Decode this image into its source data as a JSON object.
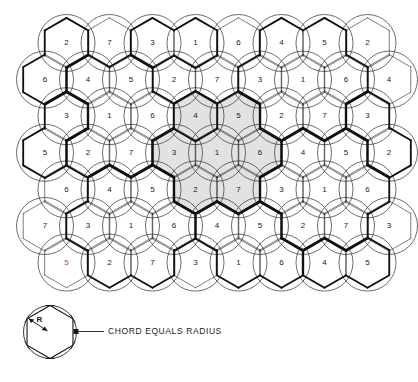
{
  "figure": {
    "geometry": {
      "circle_radius": 28.5,
      "col_spacing": 43.0,
      "row_spacing": 36.6,
      "origin_x": 66.5,
      "origin_y": 43.0,
      "odd_row_offset": -21.5
    },
    "colors": {
      "cluster_fill": "#e2e2e2",
      "circle_stroke": "#3c3c3c",
      "hex_stroke": "#111111",
      "hex_accent_green": "#2f6b3a",
      "label_text": "#1a1a1a",
      "highlight_text": "#9c4a57",
      "background": "#ffffff"
    },
    "grid": {
      "rows": [
        {
          "index": 0,
          "offset": false,
          "cells": [
            {
              "id": "r0c0",
              "label": "2",
              "shaded": false,
              "highlight": false
            },
            {
              "id": "r0c1",
              "label": "7",
              "shaded": false,
              "highlight": false
            },
            {
              "id": "r0c2",
              "label": "3",
              "shaded": false,
              "highlight": false
            },
            {
              "id": "r0c3",
              "label": "1",
              "shaded": false,
              "highlight": false
            },
            {
              "id": "r0c4",
              "label": "6",
              "shaded": false,
              "highlight": false
            },
            {
              "id": "r0c5",
              "label": "4",
              "shaded": false,
              "highlight": false
            },
            {
              "id": "r0c6",
              "label": "5",
              "shaded": false,
              "highlight": false
            },
            {
              "id": "r0c7",
              "label": "2",
              "shaded": false,
              "highlight": false
            }
          ]
        },
        {
          "index": 1,
          "offset": true,
          "cells": [
            {
              "id": "r1c0",
              "label": "6",
              "shaded": false,
              "highlight": false
            },
            {
              "id": "r1c1",
              "label": "4",
              "shaded": false,
              "highlight": false
            },
            {
              "id": "r1c2",
              "label": "5",
              "shaded": false,
              "highlight": false
            },
            {
              "id": "r1c3",
              "label": "2",
              "shaded": false,
              "highlight": false
            },
            {
              "id": "r1c4",
              "label": "7",
              "shaded": false,
              "highlight": false
            },
            {
              "id": "r1c5",
              "label": "3",
              "shaded": false,
              "highlight": false
            },
            {
              "id": "r1c6",
              "label": "1",
              "shaded": false,
              "highlight": false
            },
            {
              "id": "r1c7",
              "label": "6",
              "shaded": false,
              "highlight": false
            },
            {
              "id": "r1c8",
              "label": "4",
              "shaded": false,
              "highlight": false
            }
          ]
        },
        {
          "index": 2,
          "offset": false,
          "cells": [
            {
              "id": "r2c0",
              "label": "3",
              "shaded": false,
              "highlight": false
            },
            {
              "id": "r2c1",
              "label": "1",
              "shaded": false,
              "highlight": false
            },
            {
              "id": "r2c2",
              "label": "6",
              "shaded": false,
              "highlight": false
            },
            {
              "id": "r2c3",
              "label": "4",
              "shaded": true,
              "highlight": false
            },
            {
              "id": "r2c4",
              "label": "5",
              "shaded": true,
              "highlight": false
            },
            {
              "id": "r2c5",
              "label": "2",
              "shaded": false,
              "highlight": false
            },
            {
              "id": "r2c6",
              "label": "7",
              "shaded": false,
              "highlight": false
            },
            {
              "id": "r2c7",
              "label": "3",
              "shaded": false,
              "highlight": false
            }
          ]
        },
        {
          "index": 3,
          "offset": true,
          "cells": [
            {
              "id": "r3c0",
              "label": "5",
              "shaded": false,
              "highlight": false
            },
            {
              "id": "r3c1",
              "label": "2",
              "shaded": false,
              "highlight": false
            },
            {
              "id": "r3c2",
              "label": "7",
              "shaded": false,
              "highlight": false
            },
            {
              "id": "r3c3",
              "label": "3",
              "shaded": true,
              "highlight": false
            },
            {
              "id": "r3c4",
              "label": "1",
              "shaded": true,
              "highlight": false
            },
            {
              "id": "r3c5",
              "label": "6",
              "shaded": true,
              "highlight": false
            },
            {
              "id": "r3c6",
              "label": "4",
              "shaded": false,
              "highlight": false
            },
            {
              "id": "r3c7",
              "label": "5",
              "shaded": false,
              "highlight": false
            },
            {
              "id": "r3c8",
              "label": "2",
              "shaded": false,
              "highlight": false
            }
          ]
        },
        {
          "index": 4,
          "offset": false,
          "cells": [
            {
              "id": "r4c0",
              "label": "6",
              "shaded": false,
              "highlight": false
            },
            {
              "id": "r4c1",
              "label": "4",
              "shaded": false,
              "highlight": false
            },
            {
              "id": "r4c2",
              "label": "5",
              "shaded": false,
              "highlight": false
            },
            {
              "id": "r4c3",
              "label": "2",
              "shaded": true,
              "highlight": false
            },
            {
              "id": "r4c4",
              "label": "7",
              "shaded": true,
              "highlight": false
            },
            {
              "id": "r4c5",
              "label": "3",
              "shaded": false,
              "highlight": false
            },
            {
              "id": "r4c6",
              "label": "1",
              "shaded": false,
              "highlight": false
            },
            {
              "id": "r4c7",
              "label": "6",
              "shaded": false,
              "highlight": false
            }
          ]
        },
        {
          "index": 5,
          "offset": true,
          "cells": [
            {
              "id": "r5c0",
              "label": "7",
              "shaded": false,
              "highlight": false
            },
            {
              "id": "r5c1",
              "label": "3",
              "shaded": false,
              "highlight": false
            },
            {
              "id": "r5c2",
              "label": "1",
              "shaded": false,
              "highlight": false
            },
            {
              "id": "r5c3",
              "label": "6",
              "shaded": false,
              "highlight": false
            },
            {
              "id": "r5c4",
              "label": "4",
              "shaded": false,
              "highlight": false
            },
            {
              "id": "r5c5",
              "label": "5",
              "shaded": false,
              "highlight": false
            },
            {
              "id": "r5c6",
              "label": "2",
              "shaded": false,
              "highlight": false
            },
            {
              "id": "r5c7",
              "label": "7",
              "shaded": false,
              "highlight": false
            },
            {
              "id": "r5c8",
              "label": "3",
              "shaded": false,
              "highlight": false
            }
          ]
        },
        {
          "index": 6,
          "offset": false,
          "cells": [
            {
              "id": "r6c0",
              "label": "5",
              "shaded": false,
              "highlight": true
            },
            {
              "id": "r6c1",
              "label": "2",
              "shaded": false,
              "highlight": false
            },
            {
              "id": "r6c2",
              "label": "7",
              "shaded": false,
              "highlight": false
            },
            {
              "id": "r6c3",
              "label": "3",
              "shaded": false,
              "highlight": false
            },
            {
              "id": "r6c4",
              "label": "1",
              "shaded": false,
              "highlight": false
            },
            {
              "id": "r6c5",
              "label": "6",
              "shaded": false,
              "highlight": false
            },
            {
              "id": "r6c6",
              "label": "4",
              "shaded": false,
              "highlight": false
            },
            {
              "id": "r6c7",
              "label": "5",
              "shaded": false,
              "highlight": false
            }
          ]
        }
      ]
    },
    "cluster": {
      "name": "reuse-cluster-N7",
      "size": 7,
      "member_labels": [
        "4",
        "5",
        "3",
        "1",
        "6",
        "2",
        "7"
      ]
    }
  },
  "legend": {
    "caption": "CHORD EQUALS RADIUS",
    "radius_label": "R",
    "diagram_name": "hexagon-in-circle"
  }
}
